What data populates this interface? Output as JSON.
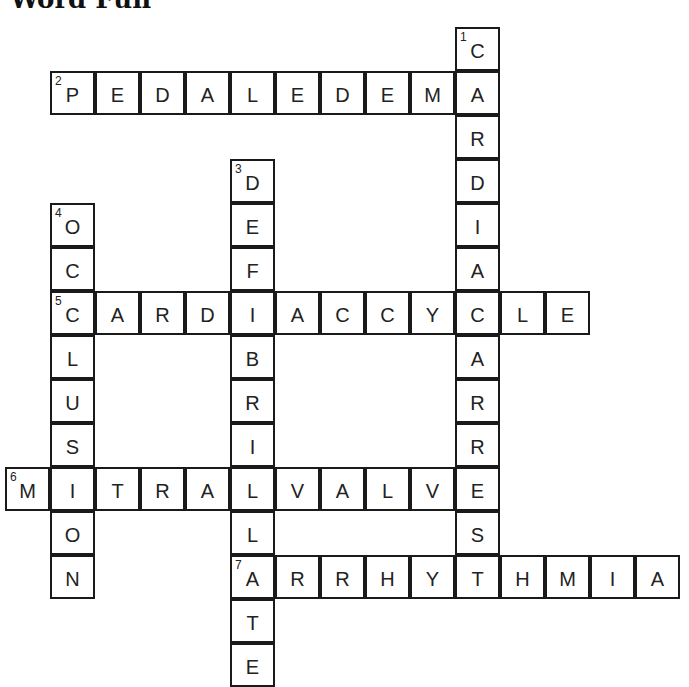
{
  "title": "Word Fun",
  "grid": {
    "origin_x": 6,
    "origin_y": 28,
    "cell_w": 45,
    "cell_h": 44
  },
  "words": [
    {
      "number": 1,
      "direction": "down",
      "answer": "CARDIACARREST",
      "row": 0,
      "col": 10
    },
    {
      "number": 2,
      "direction": "across",
      "answer": "PEDALEDEMA",
      "row": 1,
      "col": 1
    },
    {
      "number": 3,
      "direction": "down",
      "answer": "DEFIBRILLATE",
      "row": 3,
      "col": 5
    },
    {
      "number": 4,
      "direction": "down",
      "answer": "OCCLUSION",
      "row": 4,
      "col": 1
    },
    {
      "number": 5,
      "direction": "across",
      "answer": "CARDIACCYCLE",
      "row": 6,
      "col": 1
    },
    {
      "number": 6,
      "direction": "across",
      "answer": "MITRALVALVE",
      "row": 10,
      "col": 0
    },
    {
      "number": 7,
      "direction": "across",
      "answer": "ARRHYTHMIA",
      "row": 12,
      "col": 5
    }
  ]
}
